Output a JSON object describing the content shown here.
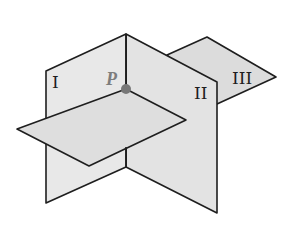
{
  "diagram": {
    "planes": [
      {
        "id": "plane-1",
        "label": "I"
      },
      {
        "id": "plane-2",
        "label": "II"
      },
      {
        "id": "plane-3",
        "label": "III"
      }
    ],
    "point": {
      "label": "P",
      "color": "#777777"
    },
    "colors": {
      "plane_fill": "#e6e6e6",
      "plane_fill_dark": "#dcdcdc",
      "edge": "#1e1e1e"
    }
  }
}
